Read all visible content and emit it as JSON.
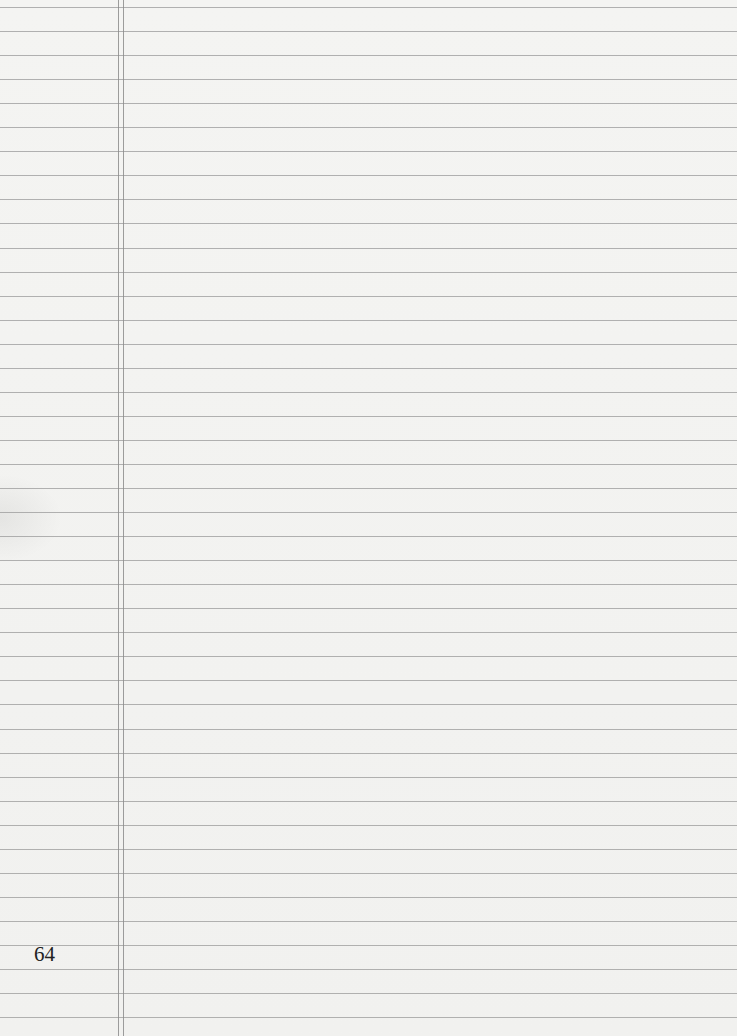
{
  "page": {
    "type": "ruled notebook page",
    "page_number": "64",
    "rule_count": 43,
    "rule_first_y": 7,
    "rule_spacing": 24.05,
    "margin_lines_x": [
      118,
      123
    ],
    "colors": {
      "paper": "#f3f3f1",
      "rule": "#9a9a9a",
      "margin": "#8c8c8c",
      "text": "#222222"
    }
  }
}
